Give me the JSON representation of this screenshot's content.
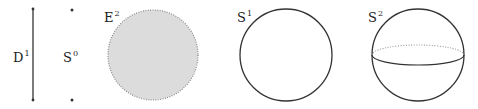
{
  "figure": {
    "colors": {
      "stroke": "#333333",
      "fill_disk": "#dcdcdc",
      "dotted_stroke": "#888888",
      "background": "#ffffff"
    },
    "items": [
      {
        "id": "d1",
        "base": "D",
        "exp": "1",
        "shape": "segment"
      },
      {
        "id": "s0",
        "base": "S",
        "exp": "0",
        "shape": "two-points"
      },
      {
        "id": "e2",
        "base": "E",
        "exp": "2",
        "shape": "filled-disk-dotted-boundary"
      },
      {
        "id": "s1",
        "base": "S",
        "exp": "1",
        "shape": "circle"
      },
      {
        "id": "s2",
        "base": "S",
        "exp": "2",
        "shape": "sphere-with-equator"
      }
    ]
  }
}
